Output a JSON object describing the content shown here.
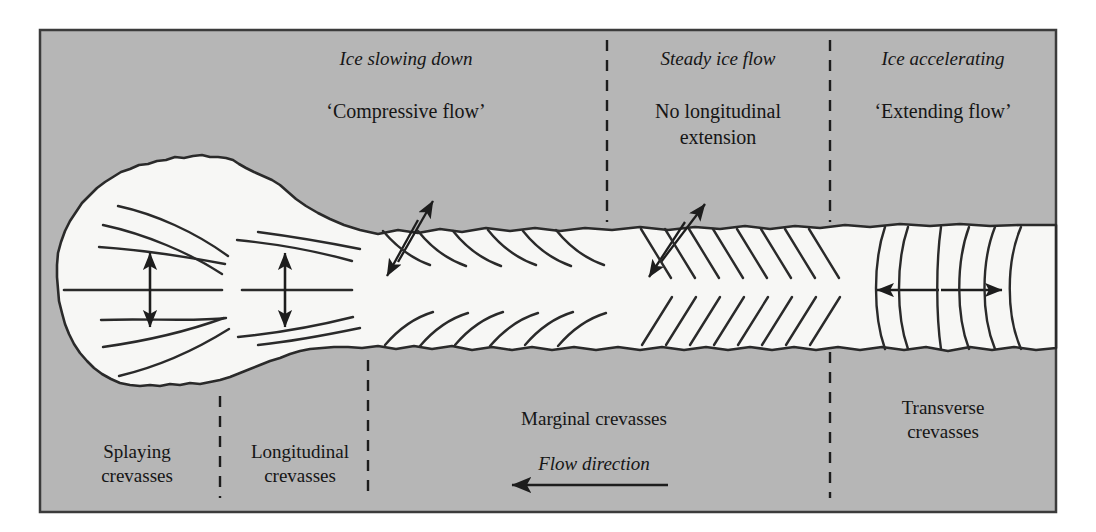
{
  "figure": {
    "kind": "glacier-crevasse-diagram",
    "canvas": {
      "width": 1096,
      "height": 532
    },
    "frame": {
      "x": 40,
      "y": 30,
      "width": 1016,
      "height": 482
    },
    "colors": {
      "page_background": "#ffffff",
      "panel_background": "#b6b6b6",
      "glacier_fill": "#f7f7f5",
      "ink": "#2a2a2a",
      "text": "#151515",
      "frame_border": "#3b3b3b"
    }
  },
  "top_labels": [
    {
      "id": "ice-slowing-down",
      "state_label": "Ice slowing down",
      "flow_label": "‘Compressive flow’",
      "center_x": 406,
      "state_y": 47,
      "flow_y": 99
    },
    {
      "id": "steady-ice-flow",
      "state_label": "Steady ice flow",
      "flow_label": "No longitudinal\nextension",
      "center_x": 718,
      "state_y": 47,
      "flow_y": 99
    },
    {
      "id": "ice-accelerating",
      "state_label": "Ice accelerating",
      "flow_label": "‘Extending flow’",
      "center_x": 943,
      "state_y": 47,
      "flow_y": 99
    }
  ],
  "bottom_labels": [
    {
      "id": "splaying-crevasses",
      "text": "Splaying\ncrevasses",
      "center_x": 137,
      "y": 440
    },
    {
      "id": "longitudinal-crevasses",
      "text": "Longitudinal\ncrevasses",
      "center_x": 295,
      "y": 440
    },
    {
      "id": "marginal-crevasses",
      "text": "Marginal crevasses",
      "center_x": 594,
      "y": 407
    },
    {
      "id": "transverse-crevasses",
      "text": "Transverse\ncrevasses",
      "center_x": 943,
      "y": 396
    }
  ],
  "flow_direction": {
    "label": "Flow direction",
    "label_center_x": 594,
    "label_y": 452,
    "arrow": {
      "x_start": 668,
      "x_end": 508,
      "y": 485
    }
  },
  "dividers": [
    {
      "id": "divider-splaying-longitudinal",
      "x": 220,
      "y_top": 396,
      "y_bottom": 498
    },
    {
      "id": "divider-longitudinal-marginal",
      "x": 368,
      "y_top": 360,
      "y_bottom": 498
    },
    {
      "id": "divider-compressive-steady-top",
      "x": 607,
      "y_top": 40,
      "y_bottom": 222
    },
    {
      "id": "divider-steady-extending-top",
      "x": 830,
      "y_top": 40,
      "y_bottom": 222
    },
    {
      "id": "divider-steady-extending-bottom",
      "x": 830,
      "y_top": 352,
      "y_bottom": 498
    }
  ],
  "zones": {
    "splaying": {
      "x_from": 57,
      "x_to": 220,
      "crevasse_count": 6
    },
    "longitudinal": {
      "x_from": 220,
      "x_to": 368,
      "crevasse_count": 3
    },
    "compressive_marginal": {
      "x_from": 380,
      "x_to": 600,
      "crevasse_count_top": 6,
      "crevasse_count_bottom": 6,
      "style": "curved"
    },
    "steady_marginal": {
      "x_from": 630,
      "x_to": 830,
      "crevasse_count_top": 8,
      "crevasse_count_bottom": 8,
      "style": "straight-45deg"
    },
    "transverse": {
      "x_from": 865,
      "x_to": 1056,
      "crevasse_count": 6,
      "style": "curved-arc"
    }
  },
  "stress_arrows": [
    {
      "id": "splaying-transverse-extension-arrow",
      "type": "double",
      "orientation": "vertical",
      "x": 150,
      "y_top": 255,
      "y_bottom": 325
    },
    {
      "id": "longitudinal-transverse-extension-arrow",
      "type": "double",
      "orientation": "vertical",
      "x": 285,
      "y_top": 255,
      "y_bottom": 325
    },
    {
      "id": "compressive-shear-arrow",
      "type": "double",
      "orientation": "diagonal",
      "x1": 431,
      "y1": 203,
      "x2": 389,
      "y2": 273
    },
    {
      "id": "steady-shear-arrow",
      "type": "double",
      "orientation": "diagonal",
      "x1": 703,
      "y1": 206,
      "x2": 651,
      "y2": 274
    },
    {
      "id": "transverse-extension-arrow",
      "type": "double",
      "orientation": "horizontal",
      "x_left": 879,
      "x_right": 1000,
      "y": 290
    }
  ],
  "centre_lines": [
    {
      "id": "splaying-centre-line",
      "x_from": 64,
      "x_to": 222,
      "y": 290
    },
    {
      "id": "longitudinal-centre-line",
      "x_from": 242,
      "x_to": 352,
      "y": 290
    }
  ]
}
